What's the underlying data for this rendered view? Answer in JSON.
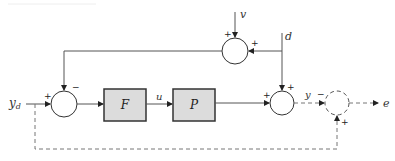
{
  "diagram": {
    "type": "block-diagram",
    "signals": {
      "reference": "y",
      "reference_sub": "d",
      "control": "u",
      "output": "y",
      "error": "e",
      "noise": "v",
      "disturbance": "d"
    },
    "blocks": [
      {
        "id": "F",
        "label": "F",
        "fill": "#dcdcdc"
      },
      {
        "id": "P",
        "label": "P",
        "fill": "#dcdcdc"
      }
    ],
    "summing_junctions": [
      {
        "id": "sum-left",
        "signs": {
          "left": "+",
          "top": "−"
        }
      },
      {
        "id": "sum-top",
        "signs": {
          "top": "+",
          "right": "+"
        }
      },
      {
        "id": "sum-right",
        "signs": {
          "left": "+",
          "top": "+"
        }
      },
      {
        "id": "sum-error",
        "style": "dashed",
        "signs": {
          "left": "−",
          "bottom": "+"
        }
      }
    ]
  }
}
